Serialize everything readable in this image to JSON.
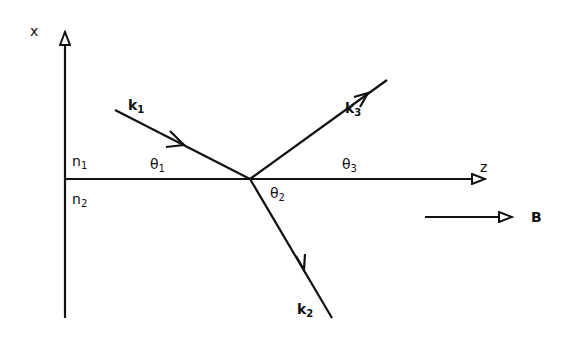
{
  "axes": {
    "x_label": "x",
    "z_label": "z"
  },
  "media": {
    "upper": {
      "symbol": "n",
      "sub": "1"
    },
    "lower": {
      "symbol": "n",
      "sub": "2"
    }
  },
  "waves": {
    "incident": {
      "symbol": "k",
      "sub": "1"
    },
    "transmitted": {
      "symbol": "k",
      "sub": "2"
    },
    "reflected": {
      "symbol": "k",
      "sub": "3"
    }
  },
  "angles": {
    "theta1": {
      "symbol": "θ",
      "sub": "1"
    },
    "theta2": {
      "symbol": "θ",
      "sub": "2"
    },
    "theta3": {
      "symbol": "θ",
      "sub": "3"
    }
  },
  "field": {
    "label": "B"
  },
  "colors": {
    "stroke": "#111111",
    "background": "#ffffff"
  }
}
